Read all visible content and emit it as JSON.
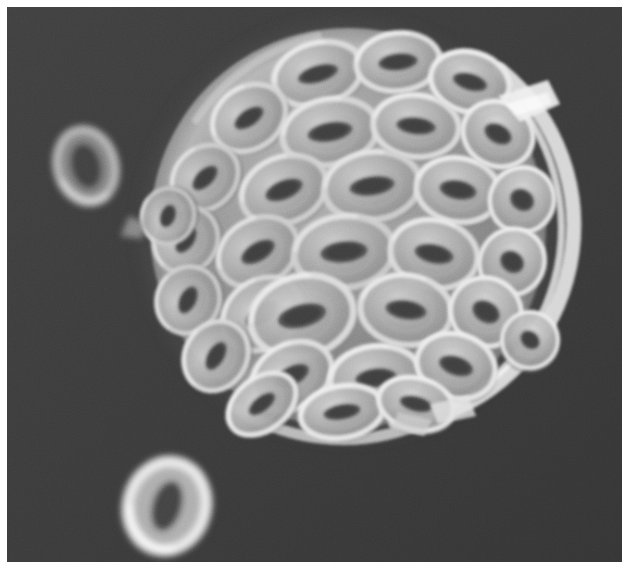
{
  "image": {
    "kind": "scanning-electron-micrograph",
    "modality": "SEM",
    "color_mode": "grayscale",
    "width_px": 626,
    "height_px": 577,
    "margins_px": {
      "top": 7,
      "left": 7,
      "right": 4,
      "bottom": 15
    },
    "frame": {
      "x": 7,
      "y": 7,
      "width": 615,
      "height": 555
    },
    "alt_text": "Grayscale scanning electron micrograph of a spherical coccosphere covered in overlapping ring-shaped coccolith plates, each with an elongated slit-like central opening, against a dark granular background with three detached coccoliths.",
    "overlay_text": [],
    "scale_bar": null,
    "labels": []
  },
  "palette": {
    "page_background": "#ffffff",
    "field_background": "#3a3a3a",
    "field_background_dark": "#2e2e2e",
    "field_background_light": "#454545",
    "specimen_mid": "#8c8c8c",
    "specimen_shadow": "#5a5a5a",
    "specimen_highlight": "#e8e8e8",
    "specimen_bright_rim": "#f6f6f6",
    "pore_dark": "#484848",
    "pore_darkest": "#3c3c3c",
    "debris_gray": "#9a9a9a"
  },
  "subject": {
    "name": "coccosphere",
    "description": "spherical biomineralized cell covering",
    "center_x": 348,
    "center_y": 228,
    "radius_x": 198,
    "radius_y": 200,
    "element_name": "coccolith",
    "element_count_visible": 31,
    "element_shape": "elliptical ring with central slit"
  },
  "detached_elements": [
    {
      "name": "coccolith-upper-left",
      "cx": 86,
      "cy": 166,
      "rx": 31,
      "ry": 39,
      "rot": -14,
      "slit_rx": 15,
      "slit_ry": 23,
      "brightness": 0.58
    },
    {
      "name": "coccolith-lower-left",
      "cx": 167,
      "cy": 506,
      "rx": 41,
      "ry": 47,
      "rot": 16,
      "slit_rx": 15,
      "slit_ry": 26,
      "brightness": 0.92
    },
    {
      "name": "debris-fragment-left",
      "cx": 138,
      "cy": 226,
      "rx": 20,
      "ry": 13,
      "rot": -24,
      "slit_rx": 0,
      "slit_ry": 0,
      "brightness": 0.45
    }
  ],
  "coccoliths": [
    {
      "cx": 318,
      "cy": 74,
      "rx": 47,
      "ry": 33,
      "rot": -16,
      "sx": 21,
      "sy": 9,
      "tone": 0.7
    },
    {
      "cx": 398,
      "cy": 62,
      "rx": 44,
      "ry": 31,
      "rot": -6,
      "sx": 20,
      "sy": 9,
      "tone": 0.74
    },
    {
      "cx": 470,
      "cy": 82,
      "rx": 42,
      "ry": 32,
      "rot": 16,
      "sx": 18,
      "sy": 9,
      "tone": 0.86
    },
    {
      "cx": 249,
      "cy": 118,
      "rx": 41,
      "ry": 33,
      "rot": -34,
      "sx": 17,
      "sy": 9,
      "tone": 0.68
    },
    {
      "cx": 330,
      "cy": 132,
      "rx": 50,
      "ry": 35,
      "rot": -10,
      "sx": 23,
      "sy": 10,
      "tone": 0.66
    },
    {
      "cx": 416,
      "cy": 126,
      "rx": 45,
      "ry": 33,
      "rot": 6,
      "sx": 20,
      "sy": 9,
      "tone": 0.72
    },
    {
      "cx": 498,
      "cy": 134,
      "rx": 38,
      "ry": 34,
      "rot": 28,
      "sx": 15,
      "sy": 10,
      "tone": 0.9
    },
    {
      "cx": 205,
      "cy": 178,
      "rx": 38,
      "ry": 32,
      "rot": -44,
      "sx": 16,
      "sy": 9,
      "tone": 0.62
    },
    {
      "cx": 284,
      "cy": 190,
      "rx": 46,
      "ry": 35,
      "rot": -22,
      "sx": 20,
      "sy": 10,
      "tone": 0.64
    },
    {
      "cx": 372,
      "cy": 186,
      "rx": 50,
      "ry": 36,
      "rot": -8,
      "sx": 23,
      "sy": 10,
      "tone": 0.63
    },
    {
      "cx": 458,
      "cy": 190,
      "rx": 44,
      "ry": 34,
      "rot": 10,
      "sx": 19,
      "sy": 10,
      "tone": 0.74
    },
    {
      "cx": 522,
      "cy": 200,
      "rx": 34,
      "ry": 35,
      "rot": 34,
      "sx": 13,
      "sy": 11,
      "tone": 0.92
    },
    {
      "cx": 186,
      "cy": 240,
      "rx": 36,
      "ry": 33,
      "rot": -56,
      "sx": 15,
      "sy": 9,
      "tone": 0.6
    },
    {
      "cx": 258,
      "cy": 252,
      "rx": 44,
      "ry": 35,
      "rot": -30,
      "sx": 19,
      "sy": 10,
      "tone": 0.62
    },
    {
      "cx": 344,
      "cy": 252,
      "rx": 52,
      "ry": 38,
      "rot": -6,
      "sx": 24,
      "sy": 11,
      "tone": 0.61
    },
    {
      "cx": 434,
      "cy": 254,
      "rx": 46,
      "ry": 36,
      "rot": 12,
      "sx": 20,
      "sy": 10,
      "tone": 0.7
    },
    {
      "cx": 512,
      "cy": 262,
      "rx": 34,
      "ry": 36,
      "rot": 36,
      "sx": 13,
      "sy": 11,
      "tone": 0.9
    },
    {
      "cx": 188,
      "cy": 300,
      "rx": 36,
      "ry": 33,
      "rot": -64,
      "sx": 15,
      "sy": 9,
      "tone": 0.62
    },
    {
      "cx": 262,
      "cy": 314,
      "rx": 44,
      "ry": 36,
      "rot": -36,
      "sx": 19,
      "sy": 10,
      "tone": 0.66
    },
    {
      "cx": 302,
      "cy": 316,
      "rx": 54,
      "ry": 42,
      "rot": -14,
      "sx": 25,
      "sy": 12,
      "tone": 0.72
    },
    {
      "cx": 406,
      "cy": 310,
      "rx": 48,
      "ry": 37,
      "rot": 8,
      "sx": 21,
      "sy": 10,
      "tone": 0.7
    },
    {
      "cx": 486,
      "cy": 312,
      "rx": 38,
      "ry": 36,
      "rot": 30,
      "sx": 15,
      "sy": 11,
      "tone": 0.86
    },
    {
      "cx": 216,
      "cy": 356,
      "rx": 38,
      "ry": 33,
      "rot": -60,
      "sx": 16,
      "sy": 9,
      "tone": 0.7
    },
    {
      "cx": 292,
      "cy": 376,
      "rx": 44,
      "ry": 34,
      "rot": -28,
      "sx": 19,
      "sy": 10,
      "tone": 0.74
    },
    {
      "cx": 376,
      "cy": 378,
      "rx": 48,
      "ry": 34,
      "rot": -6,
      "sx": 21,
      "sy": 10,
      "tone": 0.76
    },
    {
      "cx": 456,
      "cy": 366,
      "rx": 42,
      "ry": 34,
      "rot": 18,
      "sx": 18,
      "sy": 10,
      "tone": 0.82
    },
    {
      "cx": 262,
      "cy": 404,
      "rx": 40,
      "ry": 28,
      "rot": -38,
      "sx": 16,
      "sy": 8,
      "tone": 0.8
    },
    {
      "cx": 342,
      "cy": 412,
      "rx": 44,
      "ry": 28,
      "rot": -10,
      "sx": 19,
      "sy": 8,
      "tone": 0.84
    },
    {
      "cx": 416,
      "cy": 404,
      "rx": 40,
      "ry": 28,
      "rot": 14,
      "sx": 17,
      "sy": 8,
      "tone": 0.86
    },
    {
      "cx": 168,
      "cy": 216,
      "rx": 30,
      "ry": 28,
      "rot": -70,
      "sx": 12,
      "sy": 8,
      "tone": 0.58
    },
    {
      "cx": 530,
      "cy": 340,
      "rx": 30,
      "ry": 30,
      "rot": 42,
      "sx": 11,
      "sy": 9,
      "tone": 0.88
    }
  ]
}
